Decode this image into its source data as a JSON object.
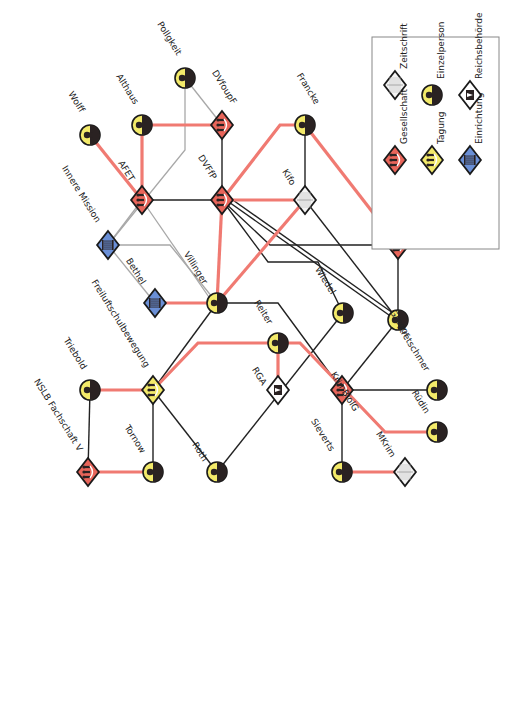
{
  "colors": {
    "gesellschaft": "#e8655a",
    "tagung": "#f3ea6a",
    "einrichtung": "#6a8fd6",
    "person_fill": "#f3ea6a",
    "person_dark": "#2a2222",
    "zeitschrift": "#f4f4f4",
    "red_edge": "#f07a72",
    "black_edge": "#222222",
    "gray_edge": "#a8a8a8",
    "outline": "#1a1a1a",
    "legend_border": "#888888"
  },
  "legend": {
    "items": [
      {
        "type": "gesellschaft",
        "label": "Gesellschaft"
      },
      {
        "type": "zeitschrift",
        "label": "Zeitschrift"
      },
      {
        "type": "tagung",
        "label": "Tagung"
      },
      {
        "type": "person",
        "label": "Einzelperson"
      },
      {
        "type": "einrichtung",
        "label": "Einrichtung"
      },
      {
        "type": "reichsbehoerde",
        "label": "Reichsbehörde"
      }
    ]
  },
  "nodes": [
    {
      "id": "pollgkeit",
      "label": "Pollgkeit",
      "type": "person",
      "x": 185,
      "y": 78
    },
    {
      "id": "wolff",
      "label": "Wolff",
      "type": "person",
      "x": 90,
      "y": 135
    },
    {
      "id": "althaus",
      "label": "Althaus",
      "type": "person",
      "x": 142,
      "y": 125
    },
    {
      "id": "dvfoupf",
      "label": "DVfoupF",
      "type": "gesellschaft",
      "x": 222,
      "y": 125
    },
    {
      "id": "francke",
      "label": "Francke",
      "type": "person",
      "x": 305,
      "y": 125
    },
    {
      "id": "afet",
      "label": "AFET",
      "type": "gesellschaft",
      "x": 142,
      "y": 200
    },
    {
      "id": "dvffp",
      "label": "DVFfP",
      "type": "gesellschaft",
      "x": 222,
      "y": 200
    },
    {
      "id": "kifo",
      "label": "Kifo",
      "type": "zeitschrift",
      "x": 305,
      "y": 200
    },
    {
      "id": "dvjj",
      "label": "DVJJ",
      "type": "gesellschaft",
      "x": 398,
      "y": 245
    },
    {
      "id": "innere",
      "label": "Innere Mission",
      "type": "einrichtung",
      "x": 108,
      "y": 245
    },
    {
      "id": "bethel",
      "label": "Bethel",
      "type": "einrichtung",
      "x": 155,
      "y": 303
    },
    {
      "id": "villinger",
      "label": "Villinger",
      "type": "person",
      "x": 217,
      "y": 303
    },
    {
      "id": "wiedel",
      "label": "Wiedel",
      "type": "person",
      "x": 343,
      "y": 313
    },
    {
      "id": "gregor",
      "label": "Gregor",
      "type": "person",
      "x": 398,
      "y": 320
    },
    {
      "id": "reiter",
      "label": "Reiter",
      "type": "person",
      "x": 278,
      "y": 343
    },
    {
      "id": "freiheit",
      "label": "Freiluftschulbewegung",
      "type": "tagung",
      "x": 153,
      "y": 390
    },
    {
      "id": "triebold",
      "label": "Triebold",
      "type": "person",
      "x": 90,
      "y": 390
    },
    {
      "id": "rga",
      "label": "RGA",
      "type": "reichsbehoerde",
      "x": 278,
      "y": 390
    },
    {
      "id": "krimbiolg",
      "label": "KrimBiolG",
      "type": "gesellschaft",
      "x": 342,
      "y": 390
    },
    {
      "id": "kretschmer",
      "label": "Kretschmer",
      "type": "person",
      "x": 437,
      "y": 390
    },
    {
      "id": "ruedin",
      "label": "Rüdin",
      "type": "person",
      "x": 437,
      "y": 432
    },
    {
      "id": "nslb",
      "label": "NSLB Fachschaft V",
      "type": "gesellschaft",
      "x": 88,
      "y": 472
    },
    {
      "id": "tornow",
      "label": "Tornow",
      "type": "person",
      "x": 153,
      "y": 472
    },
    {
      "id": "roth",
      "label": "Roth",
      "type": "person",
      "x": 217,
      "y": 472
    },
    {
      "id": "sieverts",
      "label": "Sieverts",
      "type": "person",
      "x": 342,
      "y": 472
    },
    {
      "id": "mkrim",
      "label": "MKrim",
      "type": "zeitschrift",
      "x": 405,
      "y": 472
    }
  ],
  "edges": [
    {
      "kind": "red",
      "points": [
        [
          90,
          135
        ],
        [
          142,
          200
        ]
      ]
    },
    {
      "kind": "red",
      "points": [
        [
          142,
          125
        ],
        [
          142,
          200
        ]
      ]
    },
    {
      "kind": "red",
      "points": [
        [
          142,
          125
        ],
        [
          222,
          125
        ]
      ]
    },
    {
      "kind": "red",
      "points": [
        [
          222,
          200
        ],
        [
          280,
          125
        ],
        [
          305,
          125
        ]
      ]
    },
    {
      "kind": "red",
      "points": [
        [
          305,
          125
        ],
        [
          398,
          245
        ]
      ]
    },
    {
      "kind": "red",
      "points": [
        [
          222,
          200
        ],
        [
          305,
          200
        ]
      ]
    },
    {
      "kind": "red",
      "points": [
        [
          222,
          200
        ],
        [
          217,
          303
        ]
      ]
    },
    {
      "kind": "red",
      "points": [
        [
          305,
          200
        ],
        [
          217,
          303
        ]
      ]
    },
    {
      "kind": "red",
      "points": [
        [
          155,
          303
        ],
        [
          217,
          303
        ]
      ]
    },
    {
      "kind": "red",
      "points": [
        [
          153,
          390
        ],
        [
          198,
          343
        ],
        [
          300,
          343
        ],
        [
          385,
          432
        ],
        [
          437,
          432
        ]
      ]
    },
    {
      "kind": "red",
      "points": [
        [
          278,
          343
        ],
        [
          278,
          390
        ]
      ]
    },
    {
      "kind": "red",
      "points": [
        [
          90,
          390
        ],
        [
          153,
          390
        ]
      ]
    },
    {
      "kind": "red",
      "points": [
        [
          88,
          472
        ],
        [
          153,
          472
        ]
      ]
    },
    {
      "kind": "red",
      "points": [
        [
          342,
          472
        ],
        [
          405,
          472
        ]
      ]
    },
    {
      "kind": "black",
      "points": [
        [
          222,
          125
        ],
        [
          222,
          200
        ]
      ]
    },
    {
      "kind": "black",
      "points": [
        [
          142,
          200
        ],
        [
          222,
          200
        ]
      ]
    },
    {
      "kind": "black",
      "points": [
        [
          305,
          125
        ],
        [
          305,
          200
        ]
      ]
    },
    {
      "kind": "black",
      "points": [
        [
          305,
          200
        ],
        [
          398,
          320
        ]
      ]
    },
    {
      "kind": "black",
      "points": [
        [
          398,
          245
        ],
        [
          398,
          320
        ]
      ]
    },
    {
      "kind": "black",
      "points": [
        [
          222,
          200
        ],
        [
          270,
          245
        ],
        [
          398,
          245
        ]
      ]
    },
    {
      "kind": "black",
      "points": [
        [
          222,
          200
        ],
        [
          268,
          262
        ],
        [
          318,
          262
        ],
        [
          343,
          313
        ]
      ]
    },
    {
      "kind": "black",
      "points": [
        [
          226,
          200
        ],
        [
          396,
          320
        ]
      ]
    },
    {
      "kind": "black",
      "points": [
        [
          230,
          198
        ],
        [
          400,
          318
        ]
      ]
    },
    {
      "kind": "black",
      "points": [
        [
          217,
          303
        ],
        [
          278,
          303
        ],
        [
          342,
          390
        ]
      ]
    },
    {
      "kind": "black",
      "points": [
        [
          217,
          303
        ],
        [
          153,
          390
        ]
      ]
    },
    {
      "kind": "black",
      "points": [
        [
          153,
          390
        ],
        [
          153,
          472
        ]
      ]
    },
    {
      "kind": "black",
      "points": [
        [
          153,
          390
        ],
        [
          217,
          472
        ]
      ]
    },
    {
      "kind": "black",
      "points": [
        [
          90,
          390
        ],
        [
          88,
          472
        ]
      ]
    },
    {
      "kind": "black",
      "points": [
        [
          343,
          313
        ],
        [
          217,
          472
        ]
      ]
    },
    {
      "kind": "black",
      "points": [
        [
          398,
          320
        ],
        [
          342,
          390
        ]
      ]
    },
    {
      "kind": "black",
      "points": [
        [
          342,
          390
        ],
        [
          437,
          390
        ]
      ]
    },
    {
      "kind": "black",
      "points": [
        [
          342,
          390
        ],
        [
          342,
          472
        ]
      ]
    },
    {
      "kind": "gray",
      "points": [
        [
          185,
          78
        ],
        [
          222,
          125
        ]
      ]
    },
    {
      "kind": "gray",
      "points": [
        [
          185,
          78
        ],
        [
          185,
          150
        ],
        [
          108,
          245
        ]
      ]
    },
    {
      "kind": "gray",
      "points": [
        [
          142,
          200
        ],
        [
          108,
          245
        ]
      ]
    },
    {
      "kind": "gray",
      "points": [
        [
          108,
          245
        ],
        [
          170,
          245
        ],
        [
          217,
          303
        ]
      ]
    },
    {
      "kind": "gray",
      "points": [
        [
          108,
          245
        ],
        [
          155,
          303
        ]
      ]
    },
    {
      "kind": "gray",
      "points": [
        [
          142,
          200
        ],
        [
          213,
          303
        ]
      ]
    }
  ]
}
